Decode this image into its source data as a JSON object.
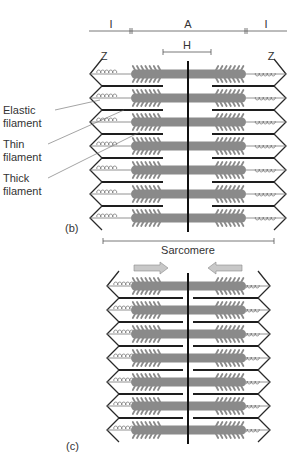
{
  "figure": {
    "panel_b": {
      "label": "(b)",
      "dimension_labels": {
        "i_left": "I",
        "a_band": "A",
        "i_right": "I",
        "h_zone": "H",
        "z_left": "Z",
        "z_right": "Z"
      },
      "callouts": [
        {
          "line1": "Elastic",
          "line2": "filament"
        },
        {
          "line1": "Thin",
          "line2": "filament"
        },
        {
          "line1": "Thick",
          "line2": "filament"
        }
      ],
      "bracket_label": "Sarcomere",
      "row_count": 7
    },
    "panel_c": {
      "label": "(c)",
      "row_count": 7,
      "arrows": [
        "right",
        "left"
      ]
    }
  },
  "colors": {
    "thick_filament": "#8a8a8a",
    "thin_filament": "#1e1e1e",
    "z_line": "#2a2a2a",
    "elastic_filament": "#777777",
    "arrow_fill": "#c8c8c8",
    "text": "#333333"
  }
}
